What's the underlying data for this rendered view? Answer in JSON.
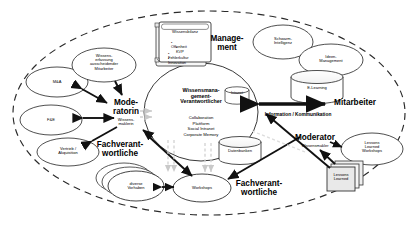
{
  "diagram": {
    "boundary": {
      "name": "organisation-boundary",
      "style": "dashed-ellipse"
    },
    "center": {
      "title": "Wissensmana-\ngement-\nVerantwortlicher",
      "items": [
        "Collaboration",
        "Plattform",
        "Social Intranet",
        "Corporate  Memory"
      ]
    },
    "wissensbilanz_box": {
      "title": "Wissensbilanz",
      "bullets": [
        "Offenheit",
        "KVP",
        "Fehlerkultur",
        "Innovation"
      ]
    },
    "roles": [
      {
        "id": "management",
        "label": "Manage-\nment",
        "sub": ""
      },
      {
        "id": "mitarbeiter",
        "label": "Mitarbeiter",
        "sub": ""
      },
      {
        "id": "moderatorin",
        "label": "Mode-\nratorin",
        "sub": "Wissens-\nmaklerin"
      },
      {
        "id": "moderator",
        "label": "Moderator",
        "sub": "Wissensmakler"
      },
      {
        "id": "fachverantwortliche-left",
        "label": "Fachverant-\nwortliche",
        "sub": ""
      },
      {
        "id": "fachverantwortliche-right",
        "label": "Fachverant-\nwortliche",
        "sub": ""
      }
    ],
    "nodes": [
      {
        "id": "m-and-a",
        "label": "M&A",
        "shape": "ellipse"
      },
      {
        "id": "f-and-e",
        "label": "F&E",
        "shape": "ellipse"
      },
      {
        "id": "vertrieb",
        "label": "Vertrieb /\nAkquisition",
        "shape": "ellipse"
      },
      {
        "id": "wissenserfassung",
        "label": "Wissens-\nerfassung\nausscheidender\nMitarbeiter",
        "shape": "ellipse"
      },
      {
        "id": "schwarm",
        "label": "Schwarm-\nIntelligenz",
        "shape": "ellipse"
      },
      {
        "id": "ideen",
        "label": "Ideen-\nManagement",
        "shape": "ellipse"
      },
      {
        "id": "lessons-ws",
        "label": "Lessons\nLearned\nWorkshops",
        "shape": "ellipse"
      },
      {
        "id": "workshops",
        "label": "Workshops",
        "shape": "ellipse"
      },
      {
        "id": "diverse",
        "label": "diverse\nVorhaben",
        "shape": "ellipse-stack"
      },
      {
        "id": "e-learning",
        "label": "E-Learning",
        "shape": "cylinder"
      },
      {
        "id": "datenbanken",
        "label": "Datenbanken",
        "shape": "cylinder"
      },
      {
        "id": "intranet",
        "label": "Intranet",
        "shape": "cylinder-small"
      },
      {
        "id": "lessons-learned",
        "label": "Lessons\nLearned",
        "shape": "document-stack"
      }
    ],
    "flows": [
      {
        "id": "info-komm",
        "label": "Information / Kommunikation"
      }
    ]
  }
}
